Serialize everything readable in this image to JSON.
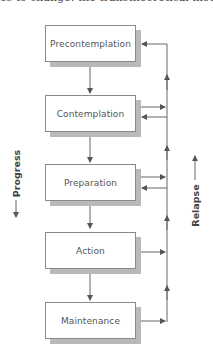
{
  "diagram": {
    "type": "flowchart",
    "stages": [
      {
        "label": "Precontemplation"
      },
      {
        "label": "Contemplation"
      },
      {
        "label": "Preparation"
      },
      {
        "label": "Action"
      },
      {
        "label": "Maintenance"
      }
    ],
    "progress_label": "Progress",
    "relapse_label": "Relapse",
    "top_text_fragment": "es to change: the transtheoretical model",
    "colors": {
      "box_border": "#8a8a8a",
      "box_shadow": "#b9b9b9",
      "line": "#555555",
      "text": "#555555"
    }
  }
}
